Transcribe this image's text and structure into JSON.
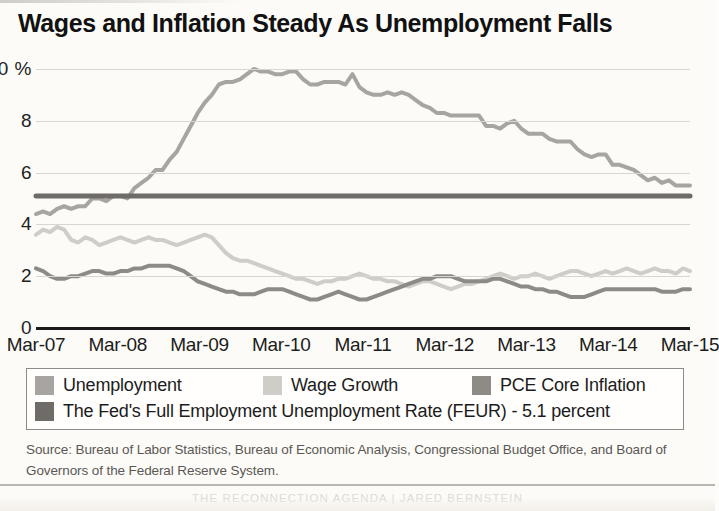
{
  "title": "Wages and Inflation Steady As Unemployment Falls",
  "source_note": "Source: Bureau of Labor Statistics, Bureau of Economic Analysis, Congressional Budget Office, and Board of Governors of the Federal Reserve System.",
  "footer": "THE RECONNECTION AGENDA | JARED BERNSTEIN",
  "legend": {
    "items": [
      {
        "label": "Unemployment",
        "color": "#a8a5a0"
      },
      {
        "label": "Wage Growth",
        "color": "#cfcdc8"
      },
      {
        "label": "PCE Core Inflation",
        "color": "#8e8b86"
      },
      {
        "label": "The Fed's Full Employment Unemployment Rate (FEUR) - 5.1 percent",
        "color": "#6f6c68"
      }
    ]
  },
  "chart_data": {
    "type": "line",
    "title": "Wages and Inflation Steady As Unemployment Falls",
    "xlabel": "",
    "ylabel": "",
    "ylim": [
      0,
      10.5
    ],
    "yticks": [
      0,
      2,
      4,
      6,
      8,
      10
    ],
    "ytick_labels": [
      "0",
      "2",
      "4",
      "6",
      "8",
      "10 %"
    ],
    "grid": true,
    "legend_position": "bottom",
    "x_tick_labels": [
      "Mar-07",
      "Mar-08",
      "Mar-09",
      "Mar-10",
      "Mar-11",
      "Mar-12",
      "Mar-13",
      "Mar-14",
      "Mar-15"
    ],
    "x_start": "Mar-07",
    "x_end": "Mar-15",
    "x_frequency": "monthly",
    "series": [
      {
        "name": "Unemployment",
        "color": "#a8a5a0",
        "values": [
          4.4,
          4.5,
          4.4,
          4.6,
          4.7,
          4.6,
          4.7,
          4.7,
          5.0,
          5.0,
          4.9,
          5.1,
          5.1,
          5.0,
          5.4,
          5.6,
          5.8,
          6.1,
          6.1,
          6.5,
          6.8,
          7.3,
          7.8,
          8.3,
          8.7,
          9.0,
          9.4,
          9.5,
          9.5,
          9.6,
          9.8,
          10.0,
          9.9,
          9.9,
          9.8,
          9.8,
          9.9,
          9.9,
          9.6,
          9.4,
          9.4,
          9.5,
          9.5,
          9.5,
          9.4,
          9.8,
          9.3,
          9.1,
          9.0,
          9.0,
          9.1,
          9.0,
          9.1,
          9.0,
          8.8,
          8.6,
          8.5,
          8.3,
          8.3,
          8.2,
          8.2,
          8.2,
          8.2,
          8.2,
          7.8,
          7.8,
          7.7,
          7.9,
          8.0,
          7.7,
          7.5,
          7.5,
          7.5,
          7.3,
          7.2,
          7.2,
          7.2,
          6.9,
          6.7,
          6.6,
          6.7,
          6.7,
          6.3,
          6.3,
          6.2,
          6.1,
          5.9,
          5.7,
          5.8,
          5.6,
          5.7,
          5.5,
          5.5,
          5.5
        ],
        "peak": {
          "value": 10.0,
          "label": "Oct-09"
        },
        "end_value": 5.5
      },
      {
        "name": "Wage Growth",
        "color": "#cfcdc8",
        "values": [
          3.6,
          3.8,
          3.7,
          3.9,
          3.8,
          3.4,
          3.3,
          3.5,
          3.4,
          3.2,
          3.3,
          3.4,
          3.5,
          3.4,
          3.3,
          3.4,
          3.5,
          3.4,
          3.4,
          3.3,
          3.2,
          3.3,
          3.4,
          3.5,
          3.6,
          3.5,
          3.2,
          2.9,
          2.7,
          2.6,
          2.6,
          2.5,
          2.4,
          2.3,
          2.2,
          2.1,
          2.0,
          1.9,
          1.9,
          1.8,
          1.7,
          1.8,
          1.8,
          1.9,
          1.9,
          2.0,
          2.1,
          2.0,
          1.9,
          1.9,
          1.8,
          1.8,
          1.7,
          1.6,
          1.7,
          1.8,
          1.8,
          1.7,
          1.6,
          1.5,
          1.6,
          1.7,
          1.7,
          1.8,
          1.9,
          2.0,
          2.1,
          2.0,
          1.9,
          2.0,
          2.0,
          2.1,
          2.0,
          1.9,
          2.0,
          2.1,
          2.2,
          2.2,
          2.1,
          2.0,
          2.1,
          2.2,
          2.1,
          2.2,
          2.3,
          2.2,
          2.1,
          2.2,
          2.3,
          2.2,
          2.2,
          2.1,
          2.3,
          2.2
        ],
        "end_value": 2.2
      },
      {
        "name": "PCE Core Inflation",
        "color": "#8e8b86",
        "values": [
          2.3,
          2.2,
          2.0,
          1.9,
          1.9,
          2.0,
          2.0,
          2.1,
          2.2,
          2.2,
          2.1,
          2.1,
          2.2,
          2.2,
          2.3,
          2.3,
          2.4,
          2.4,
          2.4,
          2.4,
          2.3,
          2.2,
          2.0,
          1.8,
          1.7,
          1.6,
          1.5,
          1.4,
          1.4,
          1.3,
          1.3,
          1.3,
          1.4,
          1.5,
          1.5,
          1.5,
          1.4,
          1.3,
          1.2,
          1.1,
          1.1,
          1.2,
          1.3,
          1.4,
          1.3,
          1.2,
          1.1,
          1.1,
          1.2,
          1.3,
          1.4,
          1.5,
          1.6,
          1.7,
          1.8,
          1.9,
          1.9,
          2.0,
          2.0,
          2.0,
          1.9,
          1.8,
          1.8,
          1.8,
          1.8,
          1.9,
          1.9,
          1.8,
          1.7,
          1.6,
          1.6,
          1.5,
          1.5,
          1.4,
          1.4,
          1.3,
          1.2,
          1.2,
          1.2,
          1.3,
          1.4,
          1.5,
          1.5,
          1.5,
          1.5,
          1.5,
          1.5,
          1.5,
          1.5,
          1.4,
          1.4,
          1.4,
          1.5,
          1.5
        ],
        "end_value": 1.5
      },
      {
        "name": "The Fed's Full Employment Unemployment Rate (FEUR) - 5.1 percent",
        "color": "#6f6c68",
        "type": "constant",
        "value": 5.1
      }
    ]
  }
}
